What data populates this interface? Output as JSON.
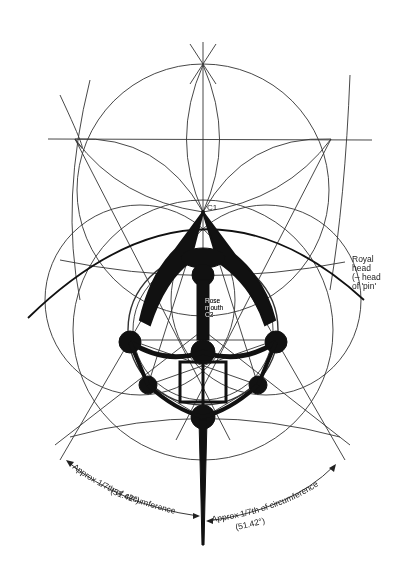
{
  "figure": {
    "labels": {
      "c1": "C1",
      "royal_head": [
        "Royal",
        "head",
        "(– head",
        "of 'pin'"
      ],
      "rose_mouth": [
        "Rose",
        "mouth",
        "C3"
      ],
      "c2": "C"
    },
    "arc_annotations": {
      "left": {
        "text": "Approx 1/7th of circumference",
        "angle": "(51.42°)"
      },
      "right": {
        "text": "Approx 1/7th of circumference",
        "angle": "(51.42°)"
      }
    },
    "colors": {
      "ink": "#111111",
      "line": "#333333",
      "background": "#ffffff"
    }
  }
}
